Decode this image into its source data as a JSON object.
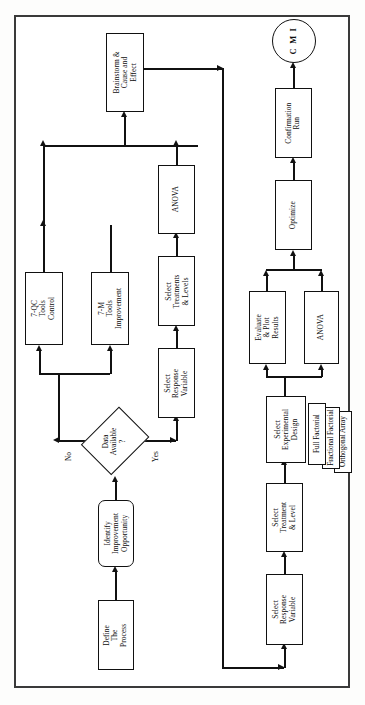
{
  "diagram": {
    "orientation": "rotated-90-ccw",
    "colors": {
      "line": "#111111",
      "frame": "#3a3a3a",
      "node_fill": "#ffffff",
      "text": "#0d0d0d"
    },
    "nodes": {
      "define_process": {
        "label": "Define\nThe\nProcess",
        "shape": "rectangle"
      },
      "identify_opportunity": {
        "label": "Identify\nImprovement\nOpportunity",
        "shape": "rounded-rectangle"
      },
      "data_available": {
        "label": "Data\nAvailable\n?",
        "shape": "diamond"
      },
      "qc_tools": {
        "label": "7-QC\nTools\nControl",
        "shape": "rectangle"
      },
      "m_tools": {
        "label": "7-M\nTools\nImprovement",
        "shape": "rectangle"
      },
      "brainstorm": {
        "label": "Brainstorm &\nCause and\nEffect",
        "shape": "rectangle"
      },
      "select_response_variable_left": {
        "label": "Select\nResponse\nVariable",
        "shape": "rectangle"
      },
      "select_treatments_levels": {
        "label": "Select\nTreatments\n& Levels",
        "shape": "rectangle"
      },
      "anova_left": {
        "label": "ANOVA",
        "shape": "rectangle"
      },
      "select_response_variable_right": {
        "label": "Select\nResponse\nVariable",
        "shape": "rectangle"
      },
      "select_treatment_level": {
        "label": "Select\nTreatment\n& Level",
        "shape": "rectangle"
      },
      "select_experimental_design": {
        "label": "Select\nExperimental\nDesign",
        "shape": "rectangle"
      },
      "full_factorial": {
        "label": "Full Factorial",
        "shape": "rectangle"
      },
      "fractional_factorial": {
        "label": "Fractional Factorial",
        "shape": "rectangle"
      },
      "orthogonal_array": {
        "label": "Orthogonal Array",
        "shape": "rectangle"
      },
      "evaluate_plot_results": {
        "label": "Evaluate\n& Plot\nResults",
        "shape": "rectangle"
      },
      "anova_right": {
        "label": "ANOVA",
        "shape": "rectangle"
      },
      "optimize": {
        "label": "Optimize",
        "shape": "rectangle"
      },
      "confirmation_run": {
        "label": "Confirmation\nRun",
        "shape": "rectangle"
      },
      "cmi_terminator": {
        "label": "C M I",
        "shape": "circle"
      }
    },
    "node_lines": {
      "define_process": [
        "Define",
        "The",
        "Process"
      ],
      "identify_opportunity": [
        "Identify",
        "Improvement",
        "Opportunity"
      ],
      "data_available": [
        "Data",
        "Available",
        "?"
      ],
      "qc_tools": [
        "7-QC",
        "Tools",
        "Control"
      ],
      "m_tools": [
        "7-M",
        "Tools",
        "Improvement"
      ],
      "brainstorm": [
        "Brainstorm &",
        "Cause and",
        "Effect"
      ],
      "select_response_variable_left": [
        "Select",
        "Response",
        "Variable"
      ],
      "select_treatments_levels": [
        "Select",
        "Treatments",
        "& Levels"
      ],
      "anova_left": [
        "ANOVA"
      ],
      "select_response_variable_right": [
        "Select",
        "Response",
        "Variable"
      ],
      "select_treatment_level": [
        "Select",
        "Treatment",
        "& Level"
      ],
      "select_experimental_design": [
        "Select",
        "Experimental",
        "Design"
      ],
      "full_factorial": [
        "Full Factorial"
      ],
      "fractional_factorial": [
        "Fractional Factorial"
      ],
      "orthogonal_array": [
        "Orthogonal Array"
      ],
      "evaluate_plot_results": [
        "Evaluate",
        "& Plot",
        "Results"
      ],
      "anova_right": [
        "ANOVA"
      ],
      "optimize": [
        "Optimize"
      ],
      "confirmation_run": [
        "Confirmation",
        "Run"
      ],
      "cmi_terminator": [
        "C M I"
      ]
    },
    "edge_labels": {
      "no": "No",
      "yes": "Yes"
    }
  }
}
